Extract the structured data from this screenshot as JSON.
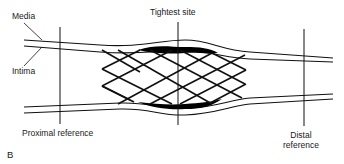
{
  "diagram": {
    "panel_letter": "B",
    "labels": {
      "media": "Media",
      "intima": "Intima",
      "tightest_site": "Tightest site",
      "proximal_reference": "Proximal reference",
      "distal_reference_line1": "Distal",
      "distal_reference_line2": "reference"
    },
    "colors": {
      "stroke": "#111111",
      "plaque": "#000000",
      "background": "#ffffff",
      "text": "#1a1a1a"
    }
  }
}
